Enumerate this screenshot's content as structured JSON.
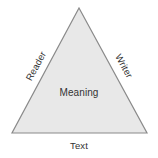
{
  "diagram": {
    "type": "communication-triangle",
    "background_color": "#ffffff",
    "shape": {
      "name": "triangle",
      "fill_color": "#e8e8e8",
      "stroke_color": "#8a8a8a",
      "stroke_width": 1.2,
      "vertices": [
        {
          "name": "apex",
          "x": 79,
          "y": 8
        },
        {
          "name": "bottom-right",
          "x": 147,
          "y": 133
        },
        {
          "name": "bottom-left",
          "x": 12,
          "y": 133
        }
      ],
      "points_attr": "79,8 147,133 12,133"
    },
    "labels": {
      "center": "Meaning",
      "left_edge": "Reader",
      "right_edge": "Writer",
      "bottom_edge": "Text"
    },
    "label_color": "#333333"
  }
}
